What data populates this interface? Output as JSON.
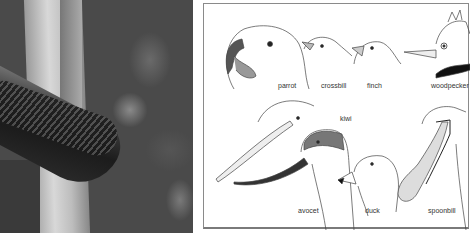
{
  "photo": {
    "subject": "bird wing and tail against tree trunk",
    "style": "black-and-white photograph"
  },
  "diagram": {
    "title": "",
    "labels": [
      {
        "id": "parrot",
        "text": "parrot"
      },
      {
        "id": "crossbill",
        "text": "crossbill"
      },
      {
        "id": "finch",
        "text": "finch"
      },
      {
        "id": "woodpecker",
        "text": "woodpecker"
      },
      {
        "id": "kiwi",
        "text": "kiwi"
      },
      {
        "id": "avocet",
        "text": "avocet"
      },
      {
        "id": "duck",
        "text": "duck"
      },
      {
        "id": "spoonbill",
        "text": "spoonbill"
      }
    ]
  },
  "colors": {
    "frame": "#8a8a8a",
    "ink": "#333333",
    "background": "#ffffff"
  }
}
